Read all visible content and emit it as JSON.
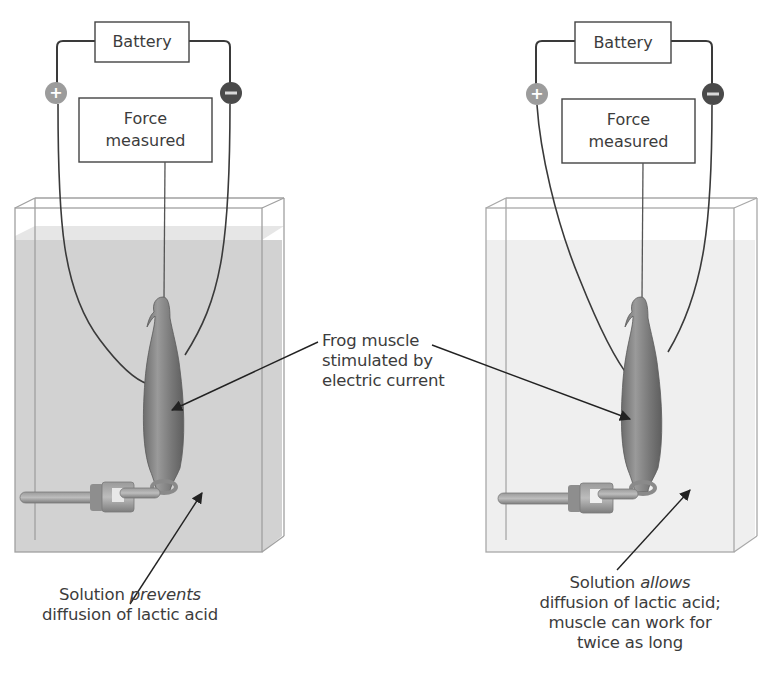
{
  "figure": {
    "colors": {
      "wire": "#3a3a3a",
      "tank_edge": "#9a9a9a",
      "solution_left": "#cfcfcf",
      "solution_right": "#eeeeee",
      "muscle": "#808080",
      "positive_terminal": "#9c9c9c",
      "negative_terminal": "#4a4a4a"
    },
    "left_setup": {
      "battery_label": "Battery",
      "force_label_line1": "Force",
      "force_label_line2": "measured",
      "positive_terminal": "+",
      "negative_terminal": "−",
      "caption_line1_prefix": "Solution ",
      "caption_line1_emphasis": "prevents",
      "caption_line2": "diffusion of lactic acid"
    },
    "right_setup": {
      "battery_label": "Battery",
      "force_label_line1": "Force",
      "force_label_line2": "measured",
      "positive_terminal": "+",
      "negative_terminal": "−",
      "caption_line1_prefix": "Solution ",
      "caption_line1_emphasis": "allows",
      "caption_line2": "diffusion of lactic acid;",
      "caption_line3": "muscle can work for",
      "caption_line4": "twice as long"
    },
    "center_label": {
      "line1": "Frog muscle",
      "line2": "stimulated by",
      "line3": "electric current"
    }
  }
}
